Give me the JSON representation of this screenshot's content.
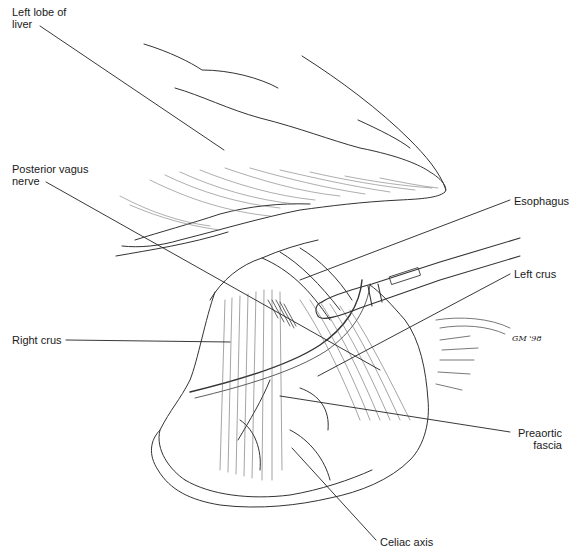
{
  "figure": {
    "type": "anatomical-illustration",
    "labels": [
      {
        "id": "left-lobe-of-liver",
        "text": "Left lobe of\nliver",
        "x": 12,
        "y": 10,
        "align": "left"
      },
      {
        "id": "posterior-vagus-nerve",
        "text": "Posterior vagus\nnerve",
        "x": 12,
        "y": 166,
        "align": "left"
      },
      {
        "id": "right-crus",
        "text": "Right crus",
        "x": 12,
        "y": 334,
        "align": "left"
      },
      {
        "id": "esophagus",
        "text": "Esophagus",
        "x": 514,
        "y": 195,
        "align": "left"
      },
      {
        "id": "left-crus",
        "text": "Left crus",
        "x": 514,
        "y": 268,
        "align": "left"
      },
      {
        "id": "preaortic-fascia",
        "text": "Preaortic\nfascia",
        "x": 512,
        "y": 428,
        "align": "right"
      },
      {
        "id": "celiac-axis",
        "text": "Celiac axis",
        "x": 380,
        "y": 537,
        "align": "left"
      }
    ],
    "signature": "GM '98",
    "colors": {
      "ink": "#1a1a1a",
      "line": "#333333",
      "background": "#ffffff"
    }
  }
}
